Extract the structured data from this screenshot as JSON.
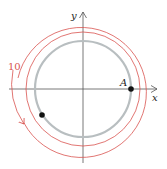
{
  "diagram": {
    "axes": {
      "x_label": "x",
      "y_label": "y"
    },
    "point_label": "A",
    "rotation_label": "10",
    "colors": {
      "axis": "#555555",
      "inner_circle": "#b8bec0",
      "orbit": "#d9534f",
      "point": "#111111",
      "label": "#222222"
    },
    "circles": [
      {
        "name": "path-circle",
        "radius": 48
      },
      {
        "name": "inner-red-circle",
        "radius": 57
      },
      {
        "name": "outer-red-arc",
        "radius": 64
      }
    ],
    "points": [
      {
        "name": "point-A",
        "label": "A"
      },
      {
        "name": "moving-point",
        "label": ""
      }
    ]
  }
}
